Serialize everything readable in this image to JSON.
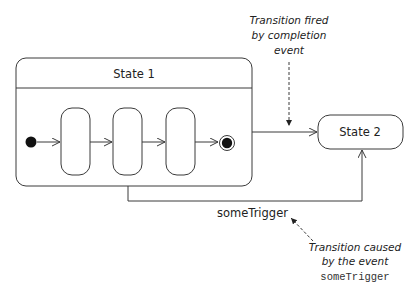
{
  "diagram": {
    "type": "uml-state-machine",
    "composite_state": {
      "name": "State 1",
      "substates": [
        {
          "id": "initial",
          "kind": "initial-pseudostate"
        },
        {
          "id": "sub1",
          "kind": "simple-state",
          "label": ""
        },
        {
          "id": "sub2",
          "kind": "simple-state",
          "label": ""
        },
        {
          "id": "sub3",
          "kind": "simple-state",
          "label": ""
        },
        {
          "id": "final",
          "kind": "final-state"
        }
      ]
    },
    "target_state": {
      "name": "State 2"
    },
    "transitions": [
      {
        "from": "State 1",
        "to": "State 2",
        "trigger": "",
        "kind": "completion"
      },
      {
        "from": "State 1",
        "to": "State 2",
        "trigger": "someTrigger",
        "kind": "event"
      }
    ],
    "labels": {
      "state1": "State 1",
      "state2": "State 2",
      "trigger": "someTrigger"
    },
    "annotations": {
      "completion": {
        "lines": [
          "Transition fired",
          "by completion",
          "event"
        ]
      },
      "event": {
        "lines": [
          "Transition caused",
          "by the event"
        ],
        "code": "someTrigger"
      }
    },
    "colors": {
      "line": "#3a3a3a",
      "text": "#222222",
      "background": "#ffffff"
    }
  }
}
